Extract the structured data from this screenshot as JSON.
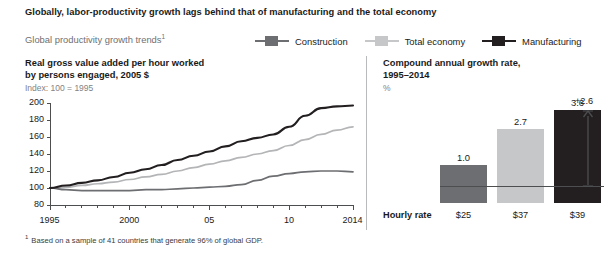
{
  "exhibit": {
    "title": "Globally, labor-productivity growth lags behind that of manufacturing and the total economy",
    "subtitle": "Global productivity growth trends",
    "subtitle_footnote_marker": "1",
    "footnote_marker": "1",
    "footnote": "Based on a sample of 41 countries that generate 96% of global GDP."
  },
  "legend": {
    "items": [
      {
        "label": "Construction",
        "color": "#6d6e71"
      },
      {
        "label": "Total economy",
        "color": "#c6c7c9"
      },
      {
        "label": "Manufacturing",
        "color": "#231f20"
      }
    ]
  },
  "left_panel": {
    "title_line1": "Real gross value added per hour worked",
    "title_line2": "by persons engaged, 2005 $",
    "subtitle": "Index: 100 = 1995"
  },
  "right_panel": {
    "title_line1": "Compound annual growth rate,",
    "title_line2": "1995–2014",
    "subtitle": "%",
    "hourly_rate_label": "Hourly rate",
    "delta_label": "+2.6"
  },
  "chart_data": [
    {
      "type": "line",
      "title": "Real gross value added per hour worked by persons engaged, 2005 $",
      "ylabel": "Index: 100 = 1995",
      "xlabel": "",
      "ylim": [
        80,
        200
      ],
      "yticks": [
        80,
        100,
        120,
        140,
        160,
        180,
        200
      ],
      "ytick_labels": [
        "80",
        "100",
        "120",
        "140",
        "160",
        "180",
        "200"
      ],
      "xlim": [
        1995,
        2014
      ],
      "xticks": [
        1995,
        2000,
        2005,
        2010,
        2014
      ],
      "xtick_labels": [
        "1995",
        "2000",
        "05",
        "10",
        "2014"
      ],
      "x": [
        1995,
        1996,
        1997,
        1998,
        1999,
        2000,
        2001,
        2002,
        2003,
        2004,
        2005,
        2006,
        2007,
        2008,
        2009,
        2010,
        2011,
        2012,
        2013,
        2014
      ],
      "grid": false,
      "legend_position": "top",
      "series": [
        {
          "name": "Manufacturing",
          "color": "#231f20",
          "values": [
            100,
            103,
            106,
            109,
            113,
            118,
            122,
            127,
            133,
            138,
            143,
            149,
            155,
            159,
            163,
            172,
            185,
            194,
            196,
            197
          ]
        },
        {
          "name": "Total economy",
          "color": "#b4b5b7",
          "values": [
            100,
            101,
            103,
            105,
            107,
            110,
            113,
            116,
            120,
            124,
            128,
            132,
            136,
            140,
            144,
            150,
            157,
            163,
            168,
            172
          ]
        },
        {
          "name": "Construction",
          "color": "#6d6e71",
          "values": [
            100,
            98,
            97,
            97,
            97,
            97,
            98,
            98,
            99,
            100,
            101,
            102,
            104,
            109,
            114,
            117,
            119,
            120,
            120,
            119
          ]
        }
      ]
    },
    {
      "type": "bar",
      "title": "Compound annual growth rate, 1995–2014",
      "ylabel": "%",
      "xlabel": "",
      "categories": [
        "Construction",
        "Total economy",
        "Manufacturing"
      ],
      "values": [
        1.0,
        2.7,
        3.6
      ],
      "value_labels": [
        "1.0",
        "2.7",
        "3.6"
      ],
      "colors": [
        "#6d6e71",
        "#c6c7c9",
        "#231f20"
      ],
      "hourly_rate_label": "Hourly rate",
      "hourly_rates": [
        "$25",
        "$37",
        "$39"
      ],
      "annotation": "+2.6",
      "grid": false,
      "legend_position": "none"
    }
  ]
}
